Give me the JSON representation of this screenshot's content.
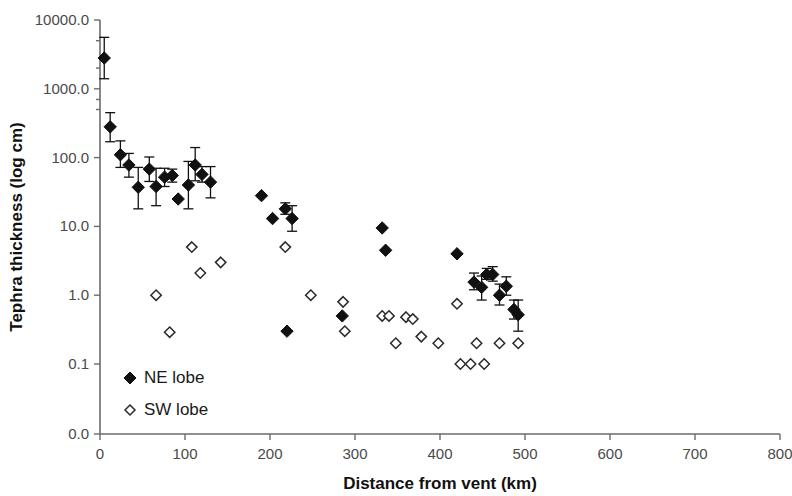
{
  "chart_data": {
    "type": "scatter",
    "title": "",
    "xlabel": "Distance from vent (km)",
    "ylabel": "Tephra thickness (log cm)",
    "xlim": [
      0,
      800
    ],
    "xticks": [
      0,
      100,
      200,
      300,
      400,
      500,
      600,
      700,
      800
    ],
    "xtick_labels": [
      "0",
      "100",
      "200",
      "300",
      "400",
      "500",
      "600",
      "700",
      "800"
    ],
    "yscale": "log",
    "yticks": [
      10000.0,
      1000.0,
      100.0,
      10.0,
      1.0,
      0.1,
      0.0
    ],
    "ytick_labels": [
      "10000.0",
      "1000.0",
      "100.0",
      "10.0",
      "1.0",
      "0.1",
      "0.0"
    ],
    "grid": false,
    "legend_position": "lower left",
    "series": [
      {
        "name": "NE lobe",
        "marker": "filled-diamond",
        "color": "#111111",
        "points": [
          {
            "x": 5,
            "y": 2800,
            "yerr_low": 1400,
            "yerr_high": 5600
          },
          {
            "x": 12,
            "y": 280,
            "yerr_low": 170,
            "yerr_high": 450
          },
          {
            "x": 24,
            "y": 110,
            "yerr_low": 72,
            "yerr_high": 175
          },
          {
            "x": 34,
            "y": 78,
            "yerr_low": 52,
            "yerr_high": 115
          },
          {
            "x": 45,
            "y": 37,
            "yerr_low": 18,
            "yerr_high": 72
          },
          {
            "x": 58,
            "y": 68,
            "yerr_low": 45,
            "yerr_high": 102
          },
          {
            "x": 66,
            "y": 38,
            "yerr_low": 20,
            "yerr_high": 70
          },
          {
            "x": 76,
            "y": 52,
            "yerr_low": 38,
            "yerr_high": 70
          },
          {
            "x": 85,
            "y": 55,
            "yerr_low": 44,
            "yerr_high": 68
          },
          {
            "x": 92,
            "y": 25,
            "yerr_low": 25,
            "yerr_high": 25
          },
          {
            "x": 104,
            "y": 40,
            "yerr_low": 18,
            "yerr_high": 88
          },
          {
            "x": 112,
            "y": 78,
            "yerr_low": 46,
            "yerr_high": 140
          },
          {
            "x": 120,
            "y": 57,
            "yerr_low": 44,
            "yerr_high": 74
          },
          {
            "x": 130,
            "y": 44,
            "yerr_low": 26,
            "yerr_high": 74
          },
          {
            "x": 190,
            "y": 28,
            "yerr_low": 28,
            "yerr_high": 28
          },
          {
            "x": 203,
            "y": 13,
            "yerr_low": 13,
            "yerr_high": 13
          },
          {
            "x": 218,
            "y": 18,
            "yerr_low": 15,
            "yerr_high": 22
          },
          {
            "x": 226,
            "y": 13,
            "yerr_low": 8.5,
            "yerr_high": 20
          },
          {
            "x": 220,
            "y": 0.3,
            "yerr_low": 0.3,
            "yerr_high": 0.3
          },
          {
            "x": 285,
            "y": 0.5,
            "yerr_low": 0.5,
            "yerr_high": 0.5
          },
          {
            "x": 332,
            "y": 9.5,
            "yerr_low": 9.5,
            "yerr_high": 9.5
          },
          {
            "x": 336,
            "y": 4.5,
            "yerr_low": 4.5,
            "yerr_high": 4.5
          },
          {
            "x": 420,
            "y": 4.0,
            "yerr_low": 4.0,
            "yerr_high": 4.0
          },
          {
            "x": 440,
            "y": 1.55,
            "yerr_low": 1.2,
            "yerr_high": 2.1
          },
          {
            "x": 449,
            "y": 1.3,
            "yerr_low": 0.85,
            "yerr_high": 1.9
          },
          {
            "x": 455,
            "y": 2.0,
            "yerr_low": 1.7,
            "yerr_high": 2.45
          },
          {
            "x": 462,
            "y": 2.0,
            "yerr_low": 1.6,
            "yerr_high": 2.6
          },
          {
            "x": 470,
            "y": 1.0,
            "yerr_low": 0.72,
            "yerr_high": 1.45
          },
          {
            "x": 478,
            "y": 1.35,
            "yerr_low": 1.0,
            "yerr_high": 1.85
          },
          {
            "x": 487,
            "y": 0.62,
            "yerr_low": 0.45,
            "yerr_high": 0.85
          },
          {
            "x": 492,
            "y": 0.52,
            "yerr_low": 0.3,
            "yerr_high": 0.85
          }
        ]
      },
      {
        "name": "SW lobe",
        "marker": "open-diamond",
        "color": "#2a2a2a",
        "points": [
          {
            "x": 66,
            "y": 1.0
          },
          {
            "x": 82,
            "y": 0.29
          },
          {
            "x": 108,
            "y": 5.0
          },
          {
            "x": 118,
            "y": 2.1
          },
          {
            "x": 142,
            "y": 3.0
          },
          {
            "x": 218,
            "y": 5.0
          },
          {
            "x": 248,
            "y": 1.0
          },
          {
            "x": 286,
            "y": 0.8
          },
          {
            "x": 288,
            "y": 0.3
          },
          {
            "x": 332,
            "y": 0.5
          },
          {
            "x": 340,
            "y": 0.5
          },
          {
            "x": 348,
            "y": 0.2
          },
          {
            "x": 360,
            "y": 0.48
          },
          {
            "x": 368,
            "y": 0.45
          },
          {
            "x": 378,
            "y": 0.25
          },
          {
            "x": 398,
            "y": 0.2
          },
          {
            "x": 420,
            "y": 0.75
          },
          {
            "x": 424,
            "y": 0.1
          },
          {
            "x": 436,
            "y": 0.1
          },
          {
            "x": 443,
            "y": 0.2
          },
          {
            "x": 452,
            "y": 0.1
          },
          {
            "x": 470,
            "y": 0.2
          },
          {
            "x": 492,
            "y": 0.2
          }
        ]
      }
    ]
  },
  "legend": {
    "items": [
      {
        "label": "NE lobe",
        "marker": "filled-diamond"
      },
      {
        "label": "SW lobe",
        "marker": "open-diamond"
      }
    ]
  }
}
